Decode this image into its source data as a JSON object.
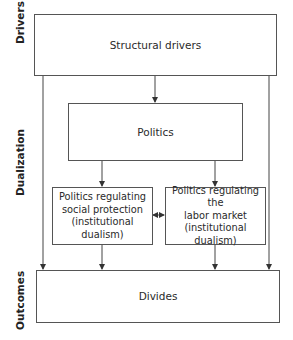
{
  "side_labels": {
    "drivers": "Drivers",
    "dualization": "Dualization",
    "outcomes": "Outcomes"
  },
  "boxes": {
    "structural_drivers": "Structural drivers",
    "politics": "Politics",
    "social_protection": {
      "line1": "Politics regulating",
      "line2": "social protection",
      "line3": "(institutional dualism)"
    },
    "labor_market": {
      "line1": "Politics regulating the",
      "line2": "labor market",
      "line3": "(institutional dualism)"
    },
    "divides": "Divides"
  },
  "colors": {
    "line": "#444444",
    "text": "#222222"
  }
}
